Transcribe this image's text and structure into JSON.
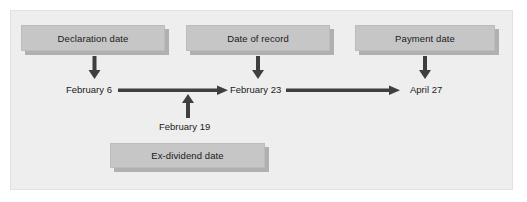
{
  "diagram": {
    "type": "timeline-flow",
    "background_color": "#eeeeee",
    "box_color": "#c6c6c6",
    "arrow_color": "#3f3f3f",
    "text_color": "#1a1a1a",
    "boxes": [
      {
        "id": "declaration",
        "label": "Declaration date",
        "position": "top-left"
      },
      {
        "id": "record",
        "label": "Date of record",
        "position": "top-center"
      },
      {
        "id": "payment",
        "label": "Payment date",
        "position": "top-right"
      },
      {
        "id": "exdividend",
        "label": "Ex-dividend date",
        "position": "bottom-center"
      }
    ],
    "timeline": {
      "events": [
        {
          "id": "feb6",
          "date_label": "February 6",
          "linked_box": "declaration",
          "arrow": "down"
        },
        {
          "id": "feb23",
          "date_label": "February 23",
          "linked_box": "record",
          "arrow": "down"
        },
        {
          "id": "apr27",
          "date_label": "April 27",
          "linked_box": "payment",
          "arrow": "down"
        },
        {
          "id": "feb19",
          "date_label": "February 19",
          "linked_box": "exdividend",
          "arrow": "up"
        }
      ],
      "segments": [
        {
          "from": "feb6",
          "to": "feb23",
          "direction": "right"
        },
        {
          "from": "feb23",
          "to": "apr27",
          "direction": "right"
        }
      ]
    },
    "icons": {
      "arrow_down": "arrow-down-icon",
      "arrow_up": "arrow-up-icon",
      "arrow_right": "arrow-right-icon"
    }
  }
}
